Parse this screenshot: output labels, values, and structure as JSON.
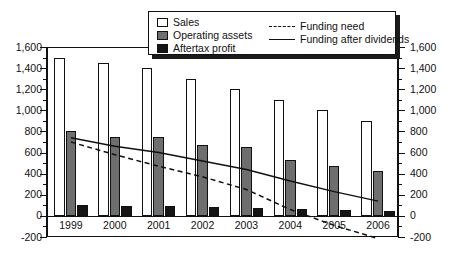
{
  "chart_data": {
    "type": "bar",
    "title": "",
    "subtitle": "",
    "xlabel": "",
    "ylabel": "",
    "ylim": [
      -200,
      1600
    ],
    "ytick_labels": [
      "1,600",
      "1,400",
      "1,200",
      "1,000",
      "800",
      "600",
      "400",
      "200",
      "0",
      "-200"
    ],
    "ytick_values": [
      1600,
      1400,
      1200,
      1000,
      800,
      600,
      400,
      200,
      0,
      -200
    ],
    "y_axis_right_labels": [
      "1,600",
      "1,400",
      "1,200",
      "1,000",
      "800",
      "600",
      "400",
      "200",
      "0",
      "-200"
    ],
    "grid": false,
    "legend_position": "top-center",
    "categories": [
      "1999",
      "2000",
      "2001",
      "2002",
      "2003",
      "2004",
      "2005",
      "2006"
    ],
    "series": [
      {
        "name": "Sales",
        "type": "bar",
        "color": "#ffffff",
        "values": [
          1500,
          1450,
          1400,
          1300,
          1200,
          1100,
          1000,
          900
        ]
      },
      {
        "name": "Operating assets",
        "type": "bar",
        "color": "#6e6e6e",
        "values": [
          800,
          750,
          750,
          675,
          650,
          525,
          470,
          425
        ]
      },
      {
        "name": "Aftertax profit",
        "type": "bar",
        "color": "#151515",
        "values": [
          100,
          95,
          90,
          80,
          75,
          62,
          52,
          42
        ]
      },
      {
        "name": "Funding need",
        "type": "line",
        "style": "dashed",
        "color": "#111111",
        "values": [
          700,
          580,
          470,
          370,
          250,
          60,
          -90,
          -215
        ]
      },
      {
        "name": "Funding after dividends",
        "type": "line",
        "style": "solid",
        "color": "#111111",
        "values": [
          740,
          660,
          600,
          520,
          440,
          330,
          230,
          140
        ]
      }
    ]
  },
  "legend": {
    "items": [
      {
        "label": "Sales",
        "key": "swatch-white"
      },
      {
        "label": "Operating assets",
        "key": "swatch-gray"
      },
      {
        "label": "Aftertax profit",
        "key": "swatch-black"
      },
      {
        "label": "Funding need",
        "key": "line-dashed"
      },
      {
        "label": "Funding after dividends",
        "key": "line-solid"
      }
    ]
  }
}
